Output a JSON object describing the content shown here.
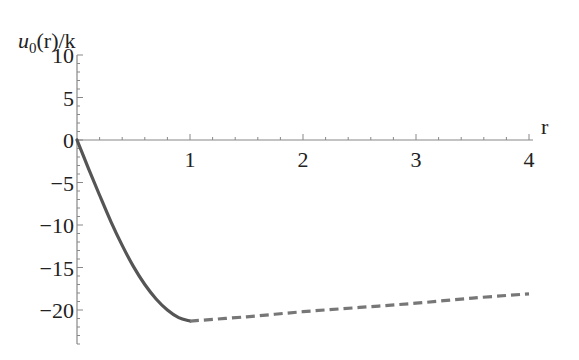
{
  "chart_data": {
    "type": "line",
    "title": "",
    "xlabel": "r",
    "ylabel": "u0(r)/k",
    "ylabel_parts": {
      "var": "u",
      "sub": "0",
      "rest": "(r)/k"
    },
    "xlim": [
      0,
      4
    ],
    "ylim": [
      -24,
      10
    ],
    "x_ticks": [
      1,
      2,
      3,
      4
    ],
    "x_tick_labels": [
      "1",
      "2",
      "3",
      "4"
    ],
    "y_ticks": [
      10,
      5,
      0,
      -5,
      -10,
      -15,
      -20
    ],
    "y_tick_labels": [
      "10",
      "5",
      "0",
      "−5",
      "−10",
      "−15",
      "−20"
    ],
    "grid": false,
    "legend": null,
    "series": [
      {
        "name": "interior (solid)",
        "style": "solid",
        "color": "#555555",
        "x": [
          0,
          0.1,
          0.2,
          0.3,
          0.4,
          0.5,
          0.6,
          0.7,
          0.8,
          0.9,
          1.0
        ],
        "y": [
          0,
          -3.3,
          -6.5,
          -9.6,
          -12.4,
          -14.9,
          -17.0,
          -18.7,
          -20.0,
          -20.9,
          -21.3
        ]
      },
      {
        "name": "exterior (dashed)",
        "style": "dashed",
        "color": "#777777",
        "x": [
          1.0,
          1.5,
          2.0,
          2.5,
          3.0,
          3.5,
          4.0
        ],
        "y": [
          -21.3,
          -20.8,
          -20.2,
          -19.7,
          -19.2,
          -18.6,
          -18.1
        ]
      }
    ]
  }
}
